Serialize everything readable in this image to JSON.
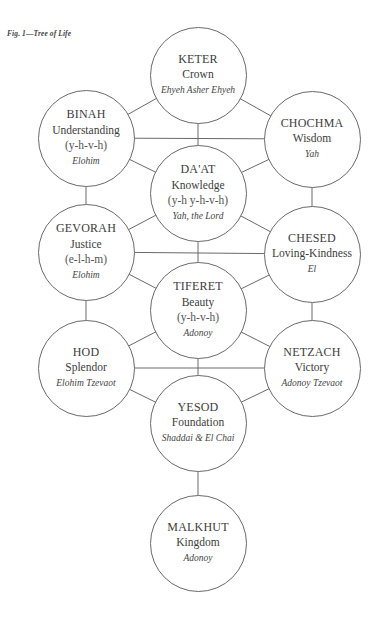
{
  "caption": "Fig. 1—Tree of Life",
  "colors": {
    "line": "#6a6a6a",
    "text": "#3c3c3c",
    "background": "#ffffff"
  },
  "sefirot": [
    {
      "id": "keter",
      "name": "KETER",
      "meaning": "Crown",
      "letters": "",
      "divine_name": "Ehyeh Asher Ehyeh",
      "cx": 198,
      "cy": 75
    },
    {
      "id": "binah",
      "name": "BINAH",
      "meaning": "Understanding",
      "letters": "(y-h-v-h)",
      "divine_name": "Elohim",
      "cx": 86,
      "cy": 138
    },
    {
      "id": "chochma",
      "name": "CHOCHMA",
      "meaning": "Wisdom",
      "letters": "",
      "divine_name": "Yah",
      "cx": 312,
      "cy": 139
    },
    {
      "id": "daat",
      "name": "DA'AT",
      "meaning": "Knowledge",
      "letters": "(y-h y-h-v-h)",
      "divine_name": "Yah, the Lord",
      "cx": 198,
      "cy": 193
    },
    {
      "id": "gevorah",
      "name": "GEVORAH",
      "meaning": "Justice",
      "letters": "(e-l-h-m)",
      "divine_name": "Elohim",
      "cx": 86,
      "cy": 252
    },
    {
      "id": "chesed",
      "name": "CHESED",
      "meaning": "Loving-Kindness",
      "letters": "",
      "divine_name": "El",
      "cx": 312,
      "cy": 254
    },
    {
      "id": "tiferet",
      "name": "TIFERET",
      "meaning": "Beauty",
      "letters": "(y-h-v-h)",
      "divine_name": "Adonoy",
      "cx": 198,
      "cy": 310
    },
    {
      "id": "hod",
      "name": "HOD",
      "meaning": "Splendor",
      "letters": "",
      "divine_name": "Elohim Tzevaot",
      "cx": 86,
      "cy": 368
    },
    {
      "id": "netzach",
      "name": "NETZACH",
      "meaning": "Victory",
      "letters": "",
      "divine_name": "Adonoy Tzevaot",
      "cx": 312,
      "cy": 368
    },
    {
      "id": "yesod",
      "name": "YESOD",
      "meaning": "Foundation",
      "letters": "",
      "divine_name": "Shaddai & El Chai",
      "cx": 198,
      "cy": 423
    },
    {
      "id": "malkhut",
      "name": "MALKHUT",
      "meaning": "Kingdom",
      "letters": "",
      "divine_name": "Adonoy",
      "cx": 198,
      "cy": 543
    }
  ],
  "paths": [
    [
      "keter",
      "binah"
    ],
    [
      "keter",
      "chochma"
    ],
    [
      "keter",
      "daat"
    ],
    [
      "binah",
      "chochma"
    ],
    [
      "binah",
      "daat"
    ],
    [
      "chochma",
      "daat"
    ],
    [
      "binah",
      "gevorah"
    ],
    [
      "chochma",
      "chesed"
    ],
    [
      "daat",
      "gevorah"
    ],
    [
      "daat",
      "chesed"
    ],
    [
      "daat",
      "tiferet"
    ],
    [
      "gevorah",
      "chesed"
    ],
    [
      "gevorah",
      "tiferet"
    ],
    [
      "chesed",
      "tiferet"
    ],
    [
      "gevorah",
      "hod"
    ],
    [
      "chesed",
      "netzach"
    ],
    [
      "tiferet",
      "hod"
    ],
    [
      "tiferet",
      "netzach"
    ],
    [
      "tiferet",
      "yesod"
    ],
    [
      "hod",
      "netzach"
    ],
    [
      "hod",
      "yesod"
    ],
    [
      "netzach",
      "yesod"
    ],
    [
      "yesod",
      "malkhut"
    ]
  ]
}
